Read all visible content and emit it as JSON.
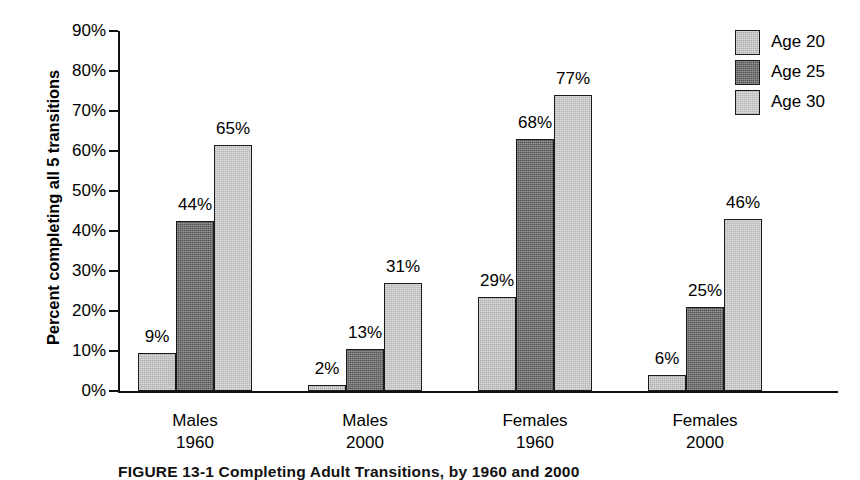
{
  "figure": {
    "caption": "FIGURE 13-1 Completing Adult Transitions, by 1960 and 2000"
  },
  "chart_data": {
    "type": "bar",
    "title": "",
    "xlabel": "",
    "ylabel": "Percent completing all 5 transitions",
    "ylim": [
      0,
      90
    ],
    "ytick_labels": [
      "0%",
      "10%",
      "20%",
      "30%",
      "40%",
      "50%",
      "60%",
      "70%",
      "80%",
      "90%"
    ],
    "ytick_values": [
      0,
      10,
      20,
      30,
      40,
      50,
      60,
      70,
      80,
      90
    ],
    "grid": false,
    "legend_position": "top-right",
    "categories": [
      "Males 1960",
      "Males 2000",
      "Females 1960",
      "Females 2000"
    ],
    "category_lines": [
      [
        "Males",
        "1960"
      ],
      [
        "Males",
        "2000"
      ],
      [
        "Females",
        "1960"
      ],
      [
        "Females",
        "2000"
      ]
    ],
    "series": [
      {
        "name": "Age 20",
        "color": "#a9a9a9",
        "values": [
          9,
          2,
          29,
          6
        ],
        "value_labels": [
          "9%",
          "2%",
          "29%",
          "6%"
        ],
        "bar_heights": [
          9.5,
          1.5,
          23.5,
          4
        ]
      },
      {
        "name": "Age 25",
        "color": "#575757",
        "values": [
          44,
          13,
          68,
          25
        ],
        "value_labels": [
          "44%",
          "13%",
          "68%",
          "25%"
        ],
        "bar_heights": [
          42.5,
          10.5,
          63,
          21
        ]
      },
      {
        "name": "Age 30",
        "color": "#dedede",
        "values": [
          65,
          31,
          77,
          46
        ],
        "value_labels": [
          "65%",
          "31%",
          "77%",
          "46%"
        ],
        "bar_heights": [
          61.5,
          27,
          74,
          43
        ]
      }
    ]
  }
}
